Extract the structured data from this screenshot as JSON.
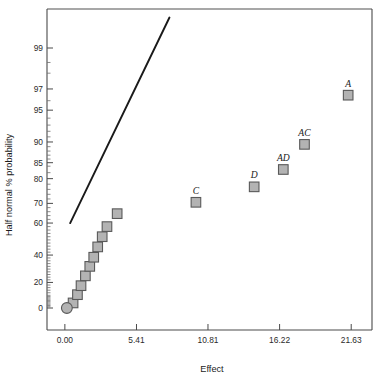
{
  "chart_data": {
    "type": "scatter",
    "title": "",
    "xlabel": "Effect",
    "ylabel": "Half normal % probability",
    "xlim": [
      -1.35,
      23.2
    ],
    "ylim": [
      -3.0,
      99.9
    ],
    "grid": false,
    "legend": null,
    "x_ticks": [
      {
        "value": 0.0,
        "label": "0.00"
      },
      {
        "value": 5.41,
        "label": "5.41"
      },
      {
        "value": 10.81,
        "label": "10.81"
      },
      {
        "value": 16.22,
        "label": "16.22"
      },
      {
        "value": 21.63,
        "label": "21.63"
      }
    ],
    "y_ticks": [
      {
        "value": 0,
        "label": "0"
      },
      {
        "value": 20,
        "label": "20"
      },
      {
        "value": 40,
        "label": "40"
      },
      {
        "value": 60,
        "label": "60"
      },
      {
        "value": 70,
        "label": "70"
      },
      {
        "value": 80,
        "label": "80"
      },
      {
        "value": 85,
        "label": "85"
      },
      {
        "value": 90,
        "label": "90"
      },
      {
        "value": 95,
        "label": "95"
      },
      {
        "value": 97,
        "label": "97"
      },
      {
        "value": 99,
        "label": "99"
      }
    ],
    "y_minor_ticks": [
      1,
      2,
      3,
      4,
      5,
      6,
      7,
      8,
      9,
      10,
      12,
      14,
      16,
      18,
      22,
      24,
      26,
      28,
      30,
      32,
      34,
      36,
      38,
      42,
      44,
      46,
      48,
      50,
      52,
      54,
      56,
      58,
      62,
      64,
      66,
      68,
      72,
      74,
      76,
      78,
      82,
      84,
      86,
      87,
      88,
      89,
      91,
      92,
      93,
      94,
      96,
      98,
      98.5
    ],
    "reference_line": {
      "x_start": 0.4,
      "y_start": 60.0,
      "x_end": 7.9,
      "y_end": 99.6,
      "color": "#1a1a1a"
    },
    "series": [
      {
        "name": "effects",
        "marker": "square",
        "color": "#b3b3b3",
        "edge_color": "#595959",
        "points": [
          {
            "x": 0.62,
            "y": 4.0,
            "label": ""
          },
          {
            "x": 0.95,
            "y": 10.5,
            "label": ""
          },
          {
            "x": 1.22,
            "y": 17.5,
            "label": ""
          },
          {
            "x": 1.55,
            "y": 25.0,
            "label": ""
          },
          {
            "x": 1.88,
            "y": 32.0,
            "label": ""
          },
          {
            "x": 2.18,
            "y": 38.5,
            "label": ""
          },
          {
            "x": 2.48,
            "y": 45.5,
            "label": ""
          },
          {
            "x": 2.82,
            "y": 52.0,
            "label": ""
          },
          {
            "x": 3.18,
            "y": 58.0,
            "label": ""
          },
          {
            "x": 3.95,
            "y": 65.0,
            "label": ""
          },
          {
            "x": 9.9,
            "y": 70.5,
            "label": "C"
          },
          {
            "x": 14.3,
            "y": 77.0,
            "label": "D"
          },
          {
            "x": 16.5,
            "y": 83.0,
            "label": "AD"
          },
          {
            "x": 18.1,
            "y": 89.5,
            "label": "AC"
          },
          {
            "x": 21.4,
            "y": 96.5,
            "label": "A"
          }
        ]
      },
      {
        "name": "origin-point",
        "marker": "circle",
        "color": "#b3b3b3",
        "edge_color": "#595959",
        "points": [
          {
            "x": 0.15,
            "y": 0.0,
            "label": ""
          }
        ]
      }
    ]
  }
}
